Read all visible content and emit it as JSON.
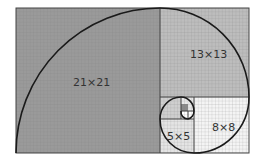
{
  "diagram": {
    "squares": [
      {
        "label": "21×21",
        "size": 21,
        "color": "#9a9a9a"
      },
      {
        "label": "13×13",
        "size": 13,
        "color": "#bdbdbd"
      },
      {
        "label": "8×8",
        "size": 8,
        "color": "#f4f4f4"
      },
      {
        "label": "5×5",
        "size": 5,
        "color": "#e4e4e4"
      },
      {
        "label": "",
        "size": 3,
        "color": "#cfcfcf"
      },
      {
        "label": "",
        "size": 2,
        "color": "#e8e8e8"
      },
      {
        "label": "",
        "size": 1,
        "color": "#8a8a8a"
      },
      {
        "label": "",
        "size": 1,
        "color": "#ffffff"
      }
    ],
    "colors": {
      "grid": "#7a7a7a",
      "spiral": "#1a1a1a",
      "border": "#444444"
    }
  }
}
